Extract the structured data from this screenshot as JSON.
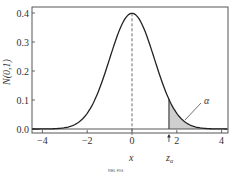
{
  "chart_data": {
    "type": "line",
    "title": "",
    "xlabel": "x",
    "ylabel": "N(0,1)",
    "xlim": [
      -4.5,
      4.3
    ],
    "ylim": [
      -0.015,
      0.415
    ],
    "x_ticks": [
      -4,
      -2,
      0,
      2,
      4
    ],
    "x_tick_labels": [
      "−4",
      "−2",
      "0",
      "2",
      "4"
    ],
    "y_ticks": [
      0.0,
      0.1,
      0.2,
      0.3,
      0.4
    ],
    "y_tick_labels": [
      "0.0",
      "0.1",
      "0.2",
      "0.3",
      "0.4"
    ],
    "grid": false,
    "legend": null,
    "series": [
      {
        "name": "standard normal pdf",
        "x": [
          -4,
          -3.5,
          -3,
          -2.5,
          -2,
          -1.5,
          -1,
          -0.5,
          0,
          0.5,
          1,
          1.5,
          2,
          2.5,
          3,
          3.5,
          4
        ],
        "values": [
          0.0001,
          0.0009,
          0.0044,
          0.0175,
          0.054,
          0.1295,
          0.242,
          0.3521,
          0.3989,
          0.3521,
          0.242,
          0.1295,
          0.054,
          0.0175,
          0.0044,
          0.0009,
          0.0001
        ]
      }
    ],
    "annotations": [
      {
        "type": "vline",
        "x": 0,
        "style": "dashed",
        "label": "x"
      },
      {
        "type": "shaded_area",
        "from": 1.65,
        "to": 4.3,
        "label": "α"
      },
      {
        "type": "arrow",
        "x": 1.65,
        "label": "zα"
      }
    ],
    "shade_start": 1.65
  },
  "labels": {
    "ylabel": "N(0,1)",
    "x_mark": "x",
    "z_mark": "z",
    "z_sub": "α",
    "alpha": "α",
    "figure_tag": "REL FIG"
  }
}
